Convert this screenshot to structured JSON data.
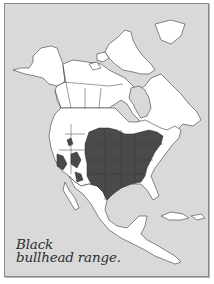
{
  "figure": {
    "caption_line1": "Black",
    "caption_line2": "bullhead range.",
    "species": "Black bullhead",
    "map_region": "North America",
    "colors": {
      "background": "#d9d9d9",
      "land": "#ffffff",
      "range": "#4a4a4a",
      "borders": "#3a3a3a",
      "frame": "#8a8a8a"
    },
    "range_description": "Central and eastern United States plus scattered western areas"
  }
}
